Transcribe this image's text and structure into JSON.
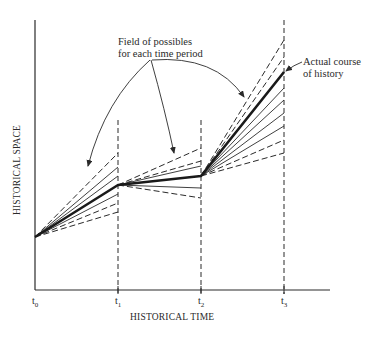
{
  "figure": {
    "annotations": {
      "field_line1": "Field of possibles",
      "field_line2": "for each time period",
      "actual_line1": "Actual course",
      "actual_line2": "of history"
    },
    "axes": {
      "x_title": "HISTORICAL TIME",
      "y_title": "HISTORICAL SPACE",
      "ticks": [
        {
          "base": "t",
          "sub": "0"
        },
        {
          "base": "t",
          "sub": "1"
        },
        {
          "base": "t",
          "sub": "2"
        },
        {
          "base": "t",
          "sub": "3"
        }
      ]
    },
    "colors": {
      "ink": "#2a2a2a",
      "background": "#ffffff"
    }
  }
}
